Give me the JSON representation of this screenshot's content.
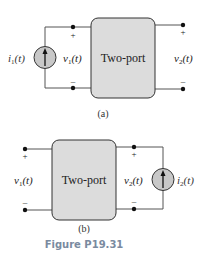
{
  "figure": {
    "caption": "Figure P19.31",
    "caption_color": "#7a8aa0"
  },
  "colors": {
    "wire": "#555555",
    "box_fill": "#dcdcdc",
    "box_stroke": "#333333",
    "source_fill": "#c8c8c8",
    "node": "#111111"
  },
  "diagram_a": {
    "label": "(a)",
    "box_label": "Two-port",
    "source_label": "i1(t)",
    "source_label_main": "i",
    "source_label_sub": "1",
    "source_label_arg": "(t)",
    "port1": {
      "voltage_main": "v",
      "voltage_sub": "1",
      "voltage_arg": "(t)",
      "plus": "+",
      "minus": "–"
    },
    "port2": {
      "voltage_main": "v",
      "voltage_sub": "2",
      "voltage_arg": "(t)",
      "plus": "+",
      "minus": "–"
    }
  },
  "diagram_b": {
    "label": "(b)",
    "box_label": "Two-port",
    "source_label_main": "i",
    "source_label_sub": "2",
    "source_label_arg": "(t)",
    "port1": {
      "voltage_main": "v",
      "voltage_sub": "1",
      "voltage_arg": "(t)",
      "plus": "+",
      "minus": "–"
    },
    "port2": {
      "voltage_main": "v",
      "voltage_sub": "2",
      "voltage_arg": "(t)",
      "plus": "+",
      "minus": "–"
    }
  }
}
